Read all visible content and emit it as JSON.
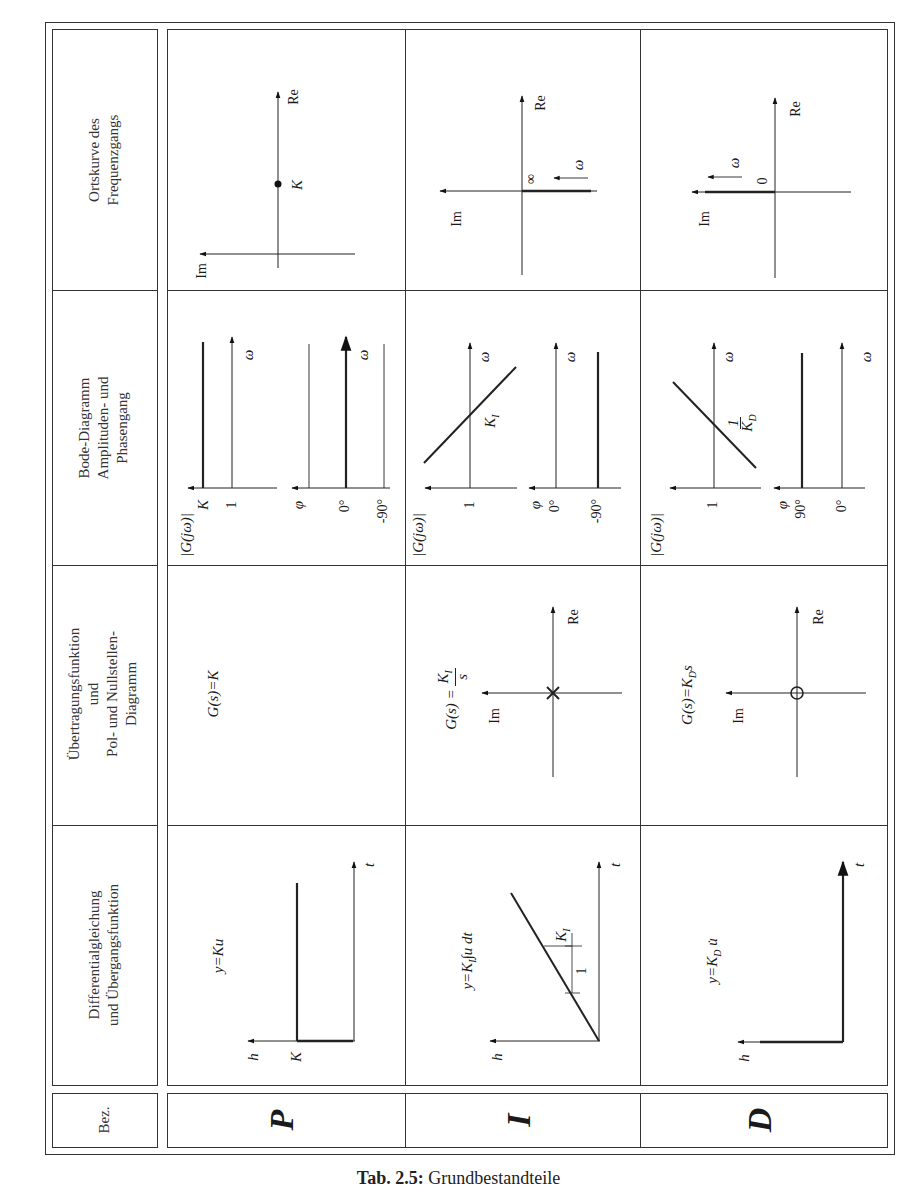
{
  "caption": {
    "label": "Tab. 2.5:",
    "text": "Grundbestandteile"
  },
  "headers": {
    "bez": "Bez.",
    "differential": [
      "Differentialgleichung",
      "und Übergangsfunktion"
    ],
    "transfer": [
      "Übertragungsfunktion",
      "und",
      "Pol- und Nullstellen-",
      "Diagramm"
    ],
    "bode": [
      "Bode-Diagramm",
      "Amplituden- und",
      "Phasengang"
    ],
    "nyquist": [
      "Ortskurve des",
      "Frequenzgangs"
    ]
  },
  "rows": [
    {
      "name": "P",
      "differential_eq": "y=Ku",
      "step_labels": {
        "h": "h",
        "t": "t",
        "level": "K"
      },
      "transfer_fn": "G(s)=K",
      "bode": {
        "mag_label": "|G(jω)|",
        "mag_ticks": [
          "K",
          "1"
        ],
        "phase_label": "φ",
        "phase_ticks": [
          "0°",
          "-90°"
        ],
        "omega": "ω"
      },
      "nyquist": {
        "re": "Re",
        "im": "Im",
        "point": "K"
      }
    },
    {
      "name": "I",
      "differential_eq": "y=K_I ∫u dt",
      "step_labels": {
        "h": "h",
        "t": "t",
        "slope": "K_I",
        "unit": "1"
      },
      "transfer_fn": "G(s)=K_I/s",
      "pz": {
        "re": "Re",
        "im": "Im",
        "marker": "pole-x"
      },
      "bode": {
        "mag_label": "|G(jω)|",
        "mag_ticks": [
          "1"
        ],
        "crossing": "K_I",
        "phase_label": "φ",
        "phase_ticks": [
          "0°",
          "-90°"
        ],
        "omega": "ω"
      },
      "nyquist": {
        "re": "Re",
        "im": "Im",
        "start": "∞",
        "omega": "ω"
      }
    },
    {
      "name": "D",
      "differential_eq": "y=K_D u̇",
      "step_labels": {
        "h": "h",
        "t": "t"
      },
      "transfer_fn": "G(s)=K_D s",
      "pz": {
        "re": "Re",
        "im": "Im",
        "marker": "zero-o"
      },
      "bode": {
        "mag_label": "|G(jω)|",
        "mag_ticks": [
          "1"
        ],
        "crossing": "1/K_D",
        "phase_label": "φ",
        "phase_ticks": [
          "90°",
          "0°"
        ],
        "omega": "ω"
      },
      "nyquist": {
        "re": "Re",
        "im": "Im",
        "start": "0",
        "omega": "ω"
      }
    }
  ],
  "text": {
    "Re": "Re",
    "Im": "Im",
    "omega": "ω",
    "h": "h",
    "t": "t",
    "K": "K",
    "one": "1",
    "phi": "φ",
    "deg0": "0°",
    "degm90": "-90°",
    "deg90": "90°",
    "inf": "∞",
    "zero": "0",
    "P": "P",
    "I": "I",
    "D": "D",
    "yKu": "y=Ku",
    "GsK": "G(s)=K",
    "Gjw": "|G(jω)|",
    "yKI_pre": "y=K",
    "yKI_post": "∫u dt",
    "sub_I": "I",
    "sub_D": "D",
    "GsKI_pre": "G(s) = ",
    "KI_K": "K",
    "s": "s",
    "GsKD_pre": "G(s)=K",
    "GsKD_post": "s",
    "yKD_pre": "y=K",
    "yKD_post": " u̇"
  }
}
